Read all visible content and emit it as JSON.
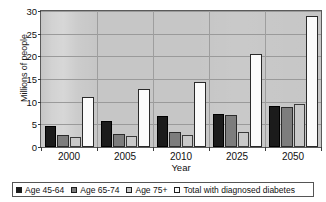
{
  "chart_data": {
    "type": "bar",
    "title": "",
    "xlabel": "Year",
    "ylabel": "Millions of people",
    "categories": [
      "2000",
      "2005",
      "2010",
      "2025",
      "2050"
    ],
    "ylim": [
      0,
      30
    ],
    "yticks": [
      0,
      5,
      10,
      15,
      20,
      25,
      30
    ],
    "grid": true,
    "legend_position": "bottom",
    "series": [
      {
        "name": "Age 45-64",
        "color": "#1b1b1b",
        "values": [
          4.6,
          5.7,
          6.8,
          7.2,
          9.0
        ]
      },
      {
        "name": "Age 65-74",
        "color": "#7d7d7d",
        "values": [
          2.6,
          2.8,
          3.4,
          7.0,
          8.8
        ]
      },
      {
        "name": "Age 75+",
        "color": "#c9c9c9",
        "values": [
          2.2,
          2.4,
          2.6,
          3.4,
          9.5
        ]
      },
      {
        "name": "Total with diagnosed diabetes",
        "color": "#fbfbfb",
        "values": [
          11.1,
          12.8,
          14.3,
          20.5,
          29.0
        ]
      }
    ]
  }
}
